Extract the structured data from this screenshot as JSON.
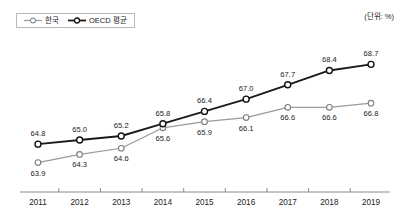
{
  "unit_note": "(단위: %)",
  "legend": {
    "position": "top-left",
    "items": [
      {
        "label": "한국",
        "color": "#9a9a9a",
        "marker": "open-circle"
      },
      {
        "label": "OECD 평균",
        "color": "#1a1a1a",
        "marker": "open-circle"
      }
    ]
  },
  "chart_data": {
    "type": "line",
    "title": "",
    "subtitle": "",
    "xlabel": "",
    "ylabel": "",
    "unit": "%",
    "grid": false,
    "legend_position": "top-left",
    "axis": {
      "x_visible": true,
      "y_visible": false,
      "ylim": [
        63.0,
        69.4
      ]
    },
    "categories": [
      "2011",
      "2012",
      "2013",
      "2014",
      "2015",
      "2016",
      "2017",
      "2018",
      "2019"
    ],
    "series": [
      {
        "name": "한국",
        "color": "#9a9a9a",
        "values": [
          63.9,
          64.3,
          64.6,
          65.6,
          65.9,
          66.1,
          66.6,
          66.6,
          66.8
        ],
        "labels": [
          "63.9",
          "64.3",
          "64.6",
          "65.6",
          "65.9",
          "66.1",
          "66.6",
          "66.6",
          "66.8"
        ],
        "label_side": [
          "below",
          "below",
          "below",
          "below",
          "below",
          "below",
          "below",
          "below",
          "below"
        ]
      },
      {
        "name": "OECD 평균",
        "color": "#1a1a1a",
        "values": [
          64.8,
          65.0,
          65.2,
          65.8,
          66.4,
          67.0,
          67.7,
          68.4,
          68.7
        ],
        "labels": [
          "64.8",
          "65.0",
          "65.2",
          "65.8",
          "66.4",
          "67.0",
          "67.7",
          "68.4",
          "68.7"
        ],
        "label_side": [
          "above",
          "above",
          "above",
          "above",
          "above",
          "above",
          "above",
          "above",
          "above"
        ]
      }
    ]
  }
}
